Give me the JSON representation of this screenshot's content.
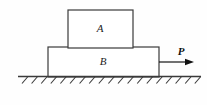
{
  "figure": {
    "background_color": "#fefefe",
    "line_color": "#3a3a3a",
    "text_color": "#1c1c1c",
    "width": 207,
    "height": 105
  },
  "blocks": [
    {
      "id": "block-a",
      "label": "A",
      "x": 68,
      "y": 10,
      "width": 65,
      "height": 38,
      "label_x": 100,
      "label_y": 29,
      "fill": "#ffffff",
      "stroke": "#3a3a3a"
    },
    {
      "id": "block-b",
      "label": "B",
      "x": 48,
      "y": 47,
      "width": 111,
      "height": 30,
      "label_x": 103,
      "label_y": 62,
      "fill": "#ffffff",
      "stroke": "#3a3a3a"
    }
  ],
  "force": {
    "label": "P",
    "label_x": 181,
    "label_y": 52,
    "arrow_x1": 159,
    "arrow_y1": 62,
    "arrow_x2": 194,
    "arrow_y2": 62,
    "direction": "right",
    "color": "#111111"
  },
  "ground": {
    "line_y": 76.5,
    "line_x1": 18,
    "line_x2": 201,
    "hatch_count": 19,
    "hatch_start_x": 22,
    "hatch_spacing": 9.6,
    "hatch_dx": -6,
    "hatch_dy": 7,
    "color": "#3a3a3a"
  }
}
